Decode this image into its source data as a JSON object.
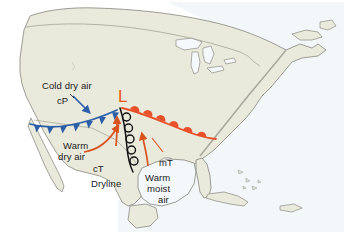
{
  "figure": {
    "type": "synoptic-weather-map"
  },
  "canvas": {
    "width": 348,
    "height": 235,
    "background": "#ffffff"
  },
  "colors": {
    "land": "#e9e9dc",
    "ocean": "#f4f8fa",
    "coastline": "#8d8d85",
    "border": "#a8a89c",
    "cold_front": "#2d5fa8",
    "warm_front": "#e8502a",
    "dryline": "#000000",
    "low_label": "#e8590c",
    "arrow_warm": "#d9531e",
    "arrow_cold": "#2d5fa8",
    "text": "#1a1a1a"
  },
  "labels": {
    "cold_dry_air": "Cold dry air",
    "cP": "cP",
    "low_pressure": "L",
    "warm_dry_air_line1": "Warm",
    "warm_dry_air_line2": "dry air",
    "cT": "cT",
    "dryline": "Dryline",
    "mT": "mT",
    "warm_moist_air_line1": "Warm",
    "warm_moist_air_line2": "moist",
    "warm_moist_air_line3": "air"
  },
  "features": [
    {
      "name": "cold-front",
      "kind": "cold front",
      "color": "#2d5fa8",
      "symbol": "filled triangles",
      "side": "south",
      "description": "Blue cold front arcing west-southwest from the low across the southwestern states to Baja California"
    },
    {
      "name": "warm-front",
      "kind": "warm front",
      "color": "#e8502a",
      "symbol": "filled semicircles",
      "side": "northeast",
      "description": "Red warm front extending east-southeast from the low toward the Carolina coast"
    },
    {
      "name": "dryline",
      "kind": "dryline",
      "color": "#000000",
      "symbol": "open semicircles",
      "side": "east",
      "description": "Black scalloped dryline running south from the low through Texas"
    },
    {
      "name": "low-center",
      "kind": "low pressure center",
      "color": "#e8590c",
      "symbol": "L",
      "description": "Surface low over the central plains where the three boundaries meet"
    }
  ],
  "air_masses": [
    {
      "code": "cP",
      "name": "Cold dry air",
      "region": "northwest / interior"
    },
    {
      "code": "cT",
      "name": "Warm dry air",
      "region": "desert southwest"
    },
    {
      "code": "mT",
      "name": "Warm moist air",
      "region": "Gulf of Mexico"
    }
  ],
  "flow_arrows": [
    {
      "name": "cP-inflow-arrow",
      "color": "#2d5fa8",
      "direction": "southeast",
      "air_mass": "cP"
    },
    {
      "name": "cT-inflow-arrow-west",
      "color": "#d9531e",
      "direction": "northeast",
      "air_mass": "cT"
    },
    {
      "name": "cT-inflow-arrow-east",
      "color": "#d9531e",
      "direction": "north-northeast",
      "air_mass": "cT"
    },
    {
      "name": "mT-inflow-arrow",
      "color": "#d9531e",
      "direction": "north",
      "air_mass": "mT"
    }
  ]
}
